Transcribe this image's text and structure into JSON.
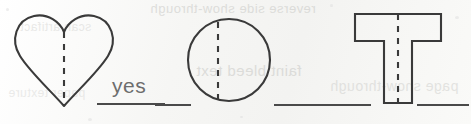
{
  "worksheet": {
    "shapes": [
      {
        "id": "heart",
        "name": "heart",
        "dashed_line": "vertical",
        "dashed_line_is_symmetry_line": true,
        "answer": "yes"
      },
      {
        "id": "circle",
        "name": "circle",
        "dashed_line": "vertical",
        "dashed_line_is_symmetry_line": false,
        "answer": ""
      },
      {
        "id": "tshape",
        "name": "letter-t",
        "dashed_line": "vertical",
        "dashed_line_is_symmetry_line": true,
        "answer": ""
      }
    ],
    "ghost_text": {
      "line1": "reverse side show-through",
      "line2": "faint bleed text",
      "line3": "scan artifact",
      "line4": "page show-through",
      "line5": "paper texture"
    },
    "colors": {
      "paper": "#f7f7f5",
      "ink": "#3a3a3a",
      "answer_line": "#4a4a4a",
      "pencil": "#6d6d6d"
    }
  }
}
